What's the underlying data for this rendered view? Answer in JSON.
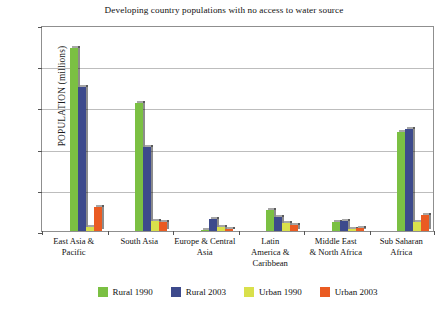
{
  "chart_data": {
    "type": "bar",
    "title": "Developing country populations with no access to water source",
    "xlabel": "",
    "ylabel": "POPULATION (millions)",
    "ylim": [
      0,
      500
    ],
    "yticks": [
      0,
      100,
      200,
      300,
      400,
      500
    ],
    "grid": true,
    "legend_position": "bottom",
    "categories": [
      "East Asia &\nPacific",
      "South Asia",
      "Europe & Central\nAsia",
      "Latin\nAmerica &\nCaribbean",
      "Middle East\n& North Africa",
      "Sub Saharan\nAfrica"
    ],
    "category_lines": [
      [
        "East Asia &",
        "Pacific"
      ],
      [
        "South Asia"
      ],
      [
        "Europe & Central",
        "Asia"
      ],
      [
        "Latin",
        "America &",
        "Caribbean"
      ],
      [
        "Middle East",
        "& North Africa"
      ],
      [
        "Sub Saharan",
        "Africa"
      ]
    ],
    "series": [
      {
        "name": "Rural 1990",
        "color": "#7bc043",
        "values": [
          445,
          310,
          3,
          50,
          22,
          240
        ]
      },
      {
        "name": "Rural 2003",
        "color": "#3d4a8c",
        "values": [
          350,
          205,
          30,
          35,
          25,
          247
        ]
      },
      {
        "name": "Urban 1990",
        "color": "#d9e04b",
        "values": [
          10,
          25,
          10,
          20,
          5,
          22
        ]
      },
      {
        "name": "Urban 2003",
        "color": "#ea5b22",
        "values": [
          58,
          22,
          5,
          15,
          7,
          40
        ]
      }
    ]
  },
  "legend": {
    "items": [
      {
        "label": "Rural 1990",
        "color": "#7bc043"
      },
      {
        "label": "Rural 2003",
        "color": "#3d4a8c"
      },
      {
        "label": "Urban 1990",
        "color": "#d9e04b"
      },
      {
        "label": "Urban 2003",
        "color": "#ea5b22"
      }
    ]
  },
  "axis": {
    "y_tick_labels": [
      "500",
      "400",
      "300",
      "200",
      "100",
      "0"
    ]
  }
}
